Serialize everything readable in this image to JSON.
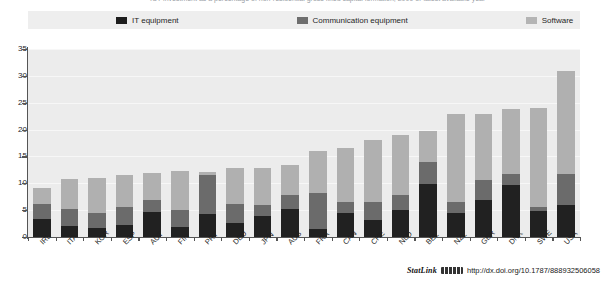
{
  "caption": {
    "clipped_top_text": "ICT investment as a percentage of non-residential gross fixed capital formation, 2009 or latest available year"
  },
  "legend": {
    "position": "top",
    "items": [
      {
        "label": "IT equipment",
        "color": "#1d1d1d",
        "icon": "legend-swatch-icon"
      },
      {
        "label": "Communication equipment",
        "color": "#6e6e6e",
        "icon": "legend-swatch-icon"
      },
      {
        "label": "Software",
        "color": "#b4b4b4",
        "icon": "legend-swatch-icon"
      }
    ]
  },
  "axis": {
    "y_ticks": [
      "35",
      "30",
      "25",
      "20",
      "15",
      "10",
      "5",
      "0"
    ]
  },
  "statlink": {
    "word": "StatLink",
    "glyph": "barcode-icon",
    "url": "http://dx.doi.org/10.1787/888932506058"
  },
  "chart_data": {
    "type": "bar",
    "stacked": true,
    "title": "",
    "xlabel": "",
    "ylabel": "",
    "ylim": [
      0,
      35
    ],
    "ytick_step": 5,
    "grid": true,
    "legend_position": "top",
    "categories": [
      "IRL",
      "ITA",
      "KOR",
      "ESP",
      "AUT",
      "FIN",
      "PRT",
      "DEU",
      "JPN",
      "AUS",
      "FRA",
      "CAN",
      "CHE",
      "NLD",
      "BEL",
      "NZL",
      "GBR",
      "DNK",
      "SWE",
      "USA"
    ],
    "series": [
      {
        "name": "IT equipment",
        "color": "#212121",
        "values": [
          3.3,
          2.0,
          1.7,
          2.3,
          4.6,
          1.8,
          4.3,
          2.6,
          3.9,
          5.3,
          1.5,
          4.5,
          3.2,
          5.0,
          9.9,
          4.4,
          6.8,
          9.7,
          4.9,
          5.9
        ]
      },
      {
        "name": "Communication equipment",
        "color": "#6b6b6b",
        "values": [
          2.9,
          3.3,
          2.8,
          3.2,
          2.2,
          3.2,
          7.3,
          3.5,
          2.0,
          2.5,
          6.7,
          2.1,
          3.3,
          2.8,
          4.0,
          2.1,
          3.9,
          2.1,
          0.6,
          5.9
        ]
      },
      {
        "name": "Software",
        "color": "#b0b0b0",
        "values": [
          2.9,
          5.5,
          6.4,
          6.1,
          5.1,
          7.3,
          0.5,
          6.7,
          7.0,
          5.7,
          7.8,
          9.9,
          11.5,
          11.2,
          5.9,
          16.4,
          12.2,
          12.1,
          18.6,
          19.2
        ]
      }
    ],
    "totals": [
      9.1,
      10.8,
      10.9,
      11.6,
      11.9,
      12.3,
      12.1,
      12.8,
      12.9,
      13.5,
      16.0,
      16.5,
      18.0,
      19.0,
      19.8,
      22.9,
      22.9,
      23.9,
      24.1,
      31.0
    ]
  }
}
